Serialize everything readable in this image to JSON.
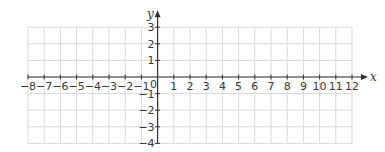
{
  "chart_data": {
    "type": "scatter",
    "title": "",
    "xlabel": "x",
    "ylabel": "y",
    "xlim": [
      -8,
      12
    ],
    "ylim": [
      -4,
      3
    ],
    "grid": true,
    "x_ticks": [
      -8,
      -7,
      -6,
      -5,
      -4,
      -3,
      -2,
      -1,
      0,
      1,
      2,
      3,
      4,
      5,
      6,
      7,
      8,
      9,
      10,
      11,
      12
    ],
    "y_ticks": [
      -4,
      -3,
      -2,
      -1,
      1,
      2,
      3
    ],
    "x_tick_labels": [
      "−8",
      "−7",
      "−6",
      "−5",
      "−4",
      "−3",
      "−2",
      "−1",
      "0",
      "1",
      "2",
      "3",
      "4",
      "5",
      "6",
      "7",
      "8",
      "9",
      "10",
      "11",
      "12"
    ],
    "y_tick_labels": [
      "−4",
      "−3",
      "−2",
      "−1",
      "1",
      "2",
      "3"
    ],
    "origin_label": "0",
    "series": [],
    "colors": {
      "grid": "#d9d9d9",
      "axis": "#333333",
      "text": "#3a3a3a"
    }
  },
  "layout": {
    "x0_px": 28,
    "x_unit_px": 16.2,
    "y0_px": 77,
    "y_unit_px": 16.6
  }
}
